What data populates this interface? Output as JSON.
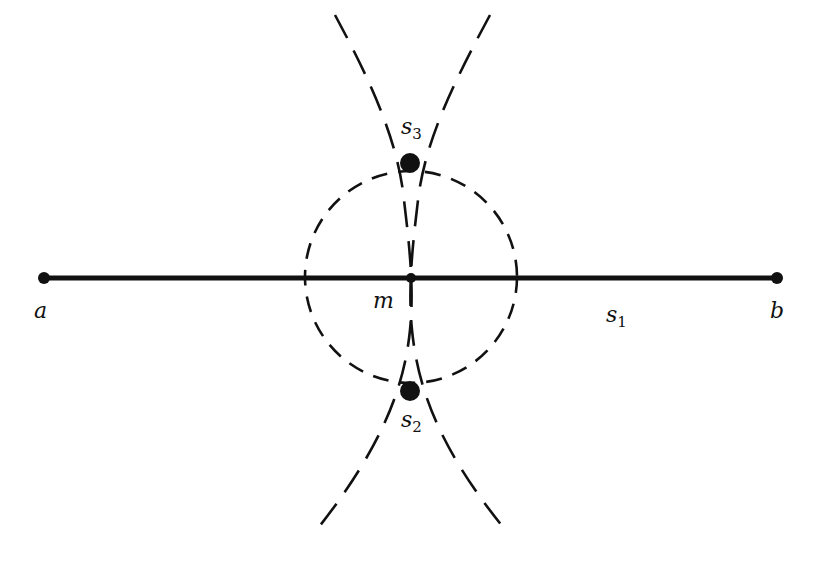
{
  "diagram": {
    "type": "geometric-construction",
    "segment": {
      "from": "a",
      "to": "b",
      "midpoint": "m"
    },
    "points": [
      {
        "id": "a",
        "label": "a",
        "x": 44,
        "y": 278
      },
      {
        "id": "b",
        "label": "b",
        "x": 777,
        "y": 278
      },
      {
        "id": "m",
        "label": "m",
        "x": 411,
        "y": 278
      },
      {
        "id": "s3",
        "label": "s",
        "subscript": "3",
        "x": 410,
        "y": 163
      },
      {
        "id": "s2",
        "label": "s",
        "subscript": "2",
        "x": 410,
        "y": 390
      }
    ],
    "segment_label": {
      "label": "s",
      "subscript": "1"
    },
    "circle": {
      "cx": 411,
      "cy": 278,
      "r": 106,
      "style": "dashed"
    },
    "curves": [
      {
        "id": "left-curve",
        "style": "dashed"
      },
      {
        "id": "right-curve",
        "style": "dashed"
      }
    ],
    "colors": {
      "ink": "#111111",
      "background": "#ffffff"
    }
  }
}
